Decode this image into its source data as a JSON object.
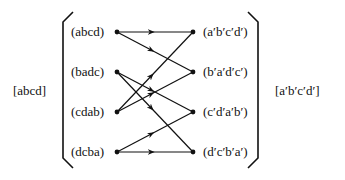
{
  "outer_left_label": "[abcd]",
  "outer_right_label": "[a′b′c′d′]",
  "left_nodes": [
    {
      "label": "(abcd)"
    },
    {
      "label": "(badc)"
    },
    {
      "label": "(cdab)"
    },
    {
      "label": "(dcba)"
    }
  ],
  "right_nodes": [
    {
      "label": "(a′b′c′d′)"
    },
    {
      "label": "(b′a′d′c′)"
    },
    {
      "label": "(c′d′a′b′)"
    },
    {
      "label": "(d′c′b′a′)"
    }
  ],
  "edges": [
    {
      "from": 0,
      "to": 0
    },
    {
      "from": 0,
      "to": 1
    },
    {
      "from": 1,
      "to": 2
    },
    {
      "from": 1,
      "to": 3
    },
    {
      "from": 2,
      "to": 0
    },
    {
      "from": 2,
      "to": 1
    },
    {
      "from": 3,
      "to": 2
    },
    {
      "from": 3,
      "to": 3
    }
  ],
  "colors": {
    "ink": "#111111",
    "background": "#ffffff"
  }
}
